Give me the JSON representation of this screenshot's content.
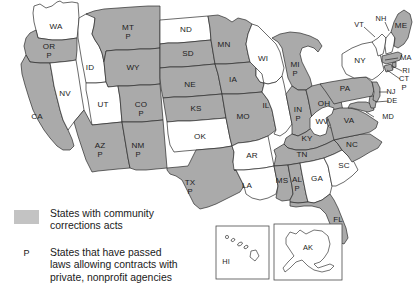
{
  "map": {
    "title": "States with community corrections acts",
    "colors": {
      "shaded_fill": "#aaaaaa",
      "unshaded_fill": "#ffffff",
      "border": "#2b2b2b",
      "background": "#ffffff",
      "legend_swatch": "#c3c3c3"
    },
    "states": [
      {
        "code": "WA",
        "shaded": false,
        "p": false
      },
      {
        "code": "OR",
        "shaded": true,
        "p": true
      },
      {
        "code": "CA",
        "shaded": true,
        "p": false
      },
      {
        "code": "NV",
        "shaded": false,
        "p": false
      },
      {
        "code": "ID",
        "shaded": false,
        "p": false
      },
      {
        "code": "MT",
        "shaded": true,
        "p": true
      },
      {
        "code": "WY",
        "shaded": true,
        "p": false
      },
      {
        "code": "UT",
        "shaded": false,
        "p": false
      },
      {
        "code": "CO",
        "shaded": true,
        "p": true
      },
      {
        "code": "AZ",
        "shaded": true,
        "p": true
      },
      {
        "code": "NM",
        "shaded": true,
        "p": true
      },
      {
        "code": "ND",
        "shaded": false,
        "p": false
      },
      {
        "code": "SD",
        "shaded": true,
        "p": false
      },
      {
        "code": "NE",
        "shaded": true,
        "p": false
      },
      {
        "code": "KS",
        "shaded": true,
        "p": false
      },
      {
        "code": "OK",
        "shaded": false,
        "p": false
      },
      {
        "code": "TX",
        "shaded": true,
        "p": true
      },
      {
        "code": "MN",
        "shaded": true,
        "p": false
      },
      {
        "code": "IA",
        "shaded": true,
        "p": false
      },
      {
        "code": "MO",
        "shaded": true,
        "p": false
      },
      {
        "code": "AR",
        "shaded": false,
        "p": false
      },
      {
        "code": "LA",
        "shaded": false,
        "p": false
      },
      {
        "code": "WI",
        "shaded": false,
        "p": false
      },
      {
        "code": "IL",
        "shaded": false,
        "p": false
      },
      {
        "code": "MI",
        "shaded": true,
        "p": true
      },
      {
        "code": "IN",
        "shaded": true,
        "p": true
      },
      {
        "code": "OH",
        "shaded": true,
        "p": false
      },
      {
        "code": "KY",
        "shaded": true,
        "p": false
      },
      {
        "code": "TN",
        "shaded": true,
        "p": false
      },
      {
        "code": "MS",
        "shaded": true,
        "p": false
      },
      {
        "code": "AL",
        "shaded": true,
        "p": true
      },
      {
        "code": "GA",
        "shaded": false,
        "p": false
      },
      {
        "code": "FL",
        "shaded": true,
        "p": false
      },
      {
        "code": "SC",
        "shaded": false,
        "p": false
      },
      {
        "code": "NC",
        "shaded": true,
        "p": false
      },
      {
        "code": "VA",
        "shaded": true,
        "p": false
      },
      {
        "code": "WV",
        "shaded": false,
        "p": false
      },
      {
        "code": "MD",
        "shaded": true,
        "p": false
      },
      {
        "code": "DE",
        "shaded": true,
        "p": false
      },
      {
        "code": "PA",
        "shaded": true,
        "p": false
      },
      {
        "code": "NJ",
        "shaded": true,
        "p": false
      },
      {
        "code": "NY",
        "shaded": false,
        "p": false
      },
      {
        "code": "CT",
        "shaded": true,
        "p": true
      },
      {
        "code": "RI",
        "shaded": true,
        "p": false
      },
      {
        "code": "MA",
        "shaded": true,
        "p": false
      },
      {
        "code": "VT",
        "shaded": false,
        "p": false
      },
      {
        "code": "NH",
        "shaded": false,
        "p": false
      },
      {
        "code": "ME",
        "shaded": true,
        "p": false
      },
      {
        "code": "HI",
        "shaded": false,
        "p": false
      },
      {
        "code": "AK",
        "shaded": false,
        "p": false
      }
    ],
    "labels": {
      "WA": "WA",
      "OR": "OR",
      "CA": "CA",
      "NV": "NV",
      "ID": "ID",
      "MT": "MT",
      "WY": "WY",
      "UT": "UT",
      "CO": "CO",
      "AZ": "AZ",
      "NM": "NM",
      "ND": "ND",
      "SD": "SD",
      "NE": "NE",
      "KS": "KS",
      "OK": "OK",
      "TX": "TX",
      "MN": "MN",
      "IA": "IA",
      "MO": "MO",
      "AR": "AR",
      "LA": "LA",
      "WI": "WI",
      "IL": "IL",
      "MI": "MI",
      "IN": "IN",
      "OH": "OH",
      "KY": "KY",
      "TN": "TN",
      "MS": "MS",
      "AL": "AL",
      "GA": "GA",
      "FL": "FL",
      "SC": "SC",
      "NC": "NC",
      "VA": "VA",
      "WV": "WV",
      "MD": "MD",
      "DE": "DE",
      "PA": "PA",
      "NJ": "NJ",
      "NY": "NY",
      "CT": "CT",
      "RI": "RI",
      "MA": "MA",
      "VT": "VT",
      "NH": "NH",
      "ME": "ME",
      "HI": "HI",
      "AK": "AK"
    },
    "p_marker": "P"
  },
  "legend": {
    "shaded_entry": {
      "marker": "swatch",
      "text": "States with community\ncorrections acts"
    },
    "p_entry": {
      "marker": "P",
      "text": "States that have passed\nlaws allowing contracts with\nprivate, nonprofit agencies"
    }
  },
  "insets": {
    "hawaii": {
      "label": "HI"
    },
    "alaska": {
      "label": "AK"
    }
  }
}
